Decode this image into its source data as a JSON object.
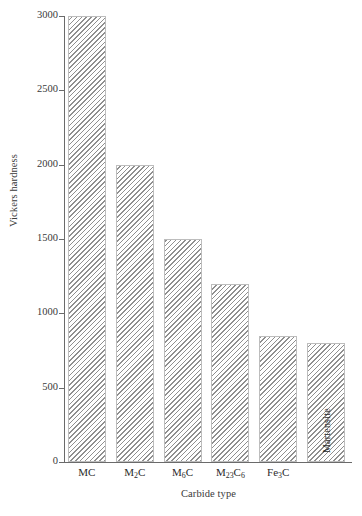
{
  "chart_data": {
    "type": "bar",
    "title": "",
    "xlabel": "Carbide type",
    "ylabel": "Vickers hardness",
    "categories": [
      "MC",
      "M2C",
      "M6C",
      "M23C6",
      "Fe3C",
      ""
    ],
    "category_labels_html": [
      "MC",
      "M<sub>2</sub>C",
      "M<sub>6</sub>C",
      "M<sub>23</sub>C<sub>6</sub>",
      "Fe<sub>3</sub>C",
      ""
    ],
    "values": [
      3000,
      2000,
      1500,
      1200,
      850,
      800
    ],
    "ylim": [
      0,
      3000
    ],
    "xlim_note": "categorical",
    "yticks": [
      0,
      500,
      1000,
      1500,
      2000,
      2500,
      3000
    ],
    "ytick_labels": [
      "0",
      "500",
      "1000",
      "1500",
      "2000",
      "2500",
      "3000"
    ],
    "grid": false,
    "legend": "none",
    "bar_fill": "diagonal-hatch",
    "bar_color": "#8f8f8f",
    "bar_edge_color": "#bdbdbd",
    "background_color": "#ffffff",
    "axis_color": "#6a6a6a",
    "annotations": [
      {
        "text": "Martensite",
        "bar_index": 5,
        "orientation": "vertical",
        "position": "inside-bottom"
      }
    ]
  },
  "axes": {
    "y_title": "Vickers hardness",
    "x_title": "Carbide type"
  }
}
